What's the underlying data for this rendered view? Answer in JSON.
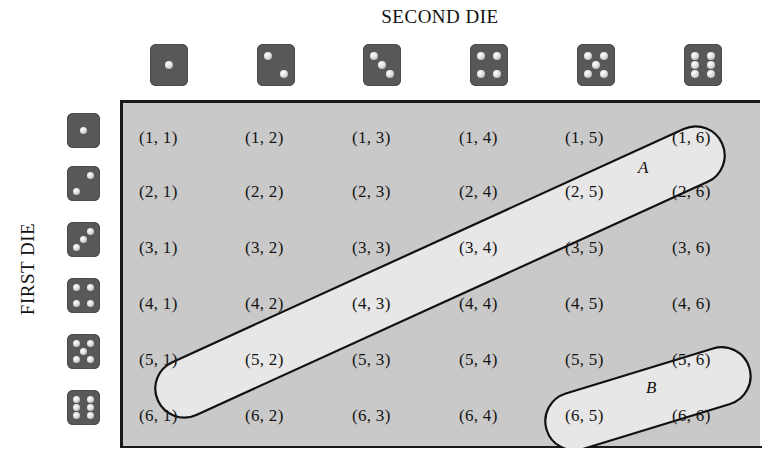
{
  "titles": {
    "top": "SECOND DIE",
    "side": "FIRST DIE"
  },
  "dice": {
    "top_values": [
      1,
      2,
      3,
      4,
      5,
      6
    ],
    "left_values": [
      1,
      2,
      3,
      4,
      5,
      6
    ],
    "face_color": "#585858",
    "pip_color": "#e8e8e8"
  },
  "grid": {
    "background": "#c9c9c9",
    "border_color": "#1a1a1a",
    "rows": [
      [
        "(1, 1)",
        "(1, 2)",
        "(1, 3)",
        "(1, 4)",
        "(1, 5)",
        "(1, 6)"
      ],
      [
        "(2, 1)",
        "(2, 2)",
        "(2, 3)",
        "(2, 4)",
        "(2, 5)",
        "(2, 6)"
      ],
      [
        "(3, 1)",
        "(3, 2)",
        "(3, 3)",
        "(3, 4)",
        "(3, 5)",
        "(3, 6)"
      ],
      [
        "(4, 1)",
        "(4, 2)",
        "(4, 3)",
        "(4, 4)",
        "(4, 5)",
        "(4, 6)"
      ],
      [
        "(5, 1)",
        "(5, 2)",
        "(5, 3)",
        "(5, 4)",
        "(5, 5)",
        "(5, 6)"
      ],
      [
        "(6, 1)",
        "(6, 2)",
        "(6, 3)",
        "(6, 4)",
        "(6, 5)",
        "(6, 6)"
      ]
    ]
  },
  "sets": {
    "a": {
      "label": "A",
      "members": [
        "(1, 6)",
        "(2, 5)",
        "(3, 4)",
        "(4, 3)",
        "(5, 2)",
        "(6, 1)"
      ],
      "fill": "#e6e6e6"
    },
    "b": {
      "label": "B",
      "members": [
        "(5, 6)",
        "(6, 5)"
      ],
      "fill": "#e6e6e6"
    }
  }
}
